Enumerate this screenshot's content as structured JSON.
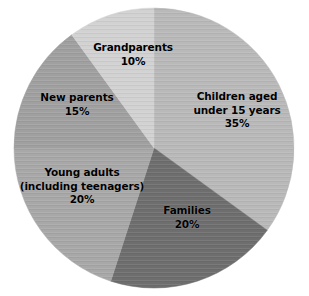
{
  "chart_data": {
    "type": "pie",
    "title": "",
    "subtitle": "",
    "xlabel": "",
    "ylabel": "",
    "units": "percent",
    "legend_position": "none",
    "labels_position": "inside-slices",
    "grid": false,
    "total": 100,
    "start_angle_deg": 0,
    "direction": "clockwise",
    "categories": [
      "Children aged under 15 years",
      "Families",
      "Young adults (including teenagers)",
      "New parents",
      "Grandparents"
    ],
    "values": [
      35,
      20,
      20,
      15,
      10
    ],
    "slices": [
      {
        "name": "children-aged-under-15-years",
        "label_lines": [
          "Children aged",
          "under 15 years"
        ],
        "value": 35,
        "value_label": "35%",
        "color": "#b9b9b9",
        "angle_deg": 126,
        "start_deg": 0,
        "end_deg": 126
      },
      {
        "name": "families",
        "label_lines": [
          "Families"
        ],
        "value": 20,
        "value_label": "20%",
        "color": "#6e6e6e",
        "angle_deg": 72,
        "start_deg": 126,
        "end_deg": 198
      },
      {
        "name": "young-adults",
        "label_lines": [
          "Young adults",
          "(including teenagers)"
        ],
        "value": 20,
        "value_label": "20%",
        "color": "#a8a8a8",
        "angle_deg": 72,
        "start_deg": 198,
        "end_deg": 270
      },
      {
        "name": "new-parents",
        "label_lines": [
          "New parents"
        ],
        "value": 15,
        "value_label": "15%",
        "color": "#a0a0a0",
        "angle_deg": 54,
        "start_deg": 270,
        "end_deg": 324
      },
      {
        "name": "grandparents",
        "label_lines": [
          "Grandparents"
        ],
        "value": 10,
        "value_label": "10%",
        "color": "#d2d2d2",
        "angle_deg": 36,
        "start_deg": 324,
        "end_deg": 360
      }
    ]
  },
  "labels": {
    "children": {
      "line1": "Children aged",
      "line2": "under 15 years",
      "value": "35%"
    },
    "families": {
      "line1": "Families",
      "value": "20%"
    },
    "young_adults": {
      "line1": "Young adults",
      "line2": "(including teenagers)",
      "value": "20%"
    },
    "new_parents": {
      "line1": "New parents",
      "value": "15%"
    },
    "grandparents": {
      "line1": "Grandparents",
      "value": "10%"
    }
  },
  "colors": {
    "background": "#ffffff",
    "text": "#000000",
    "children": "#b9b9b9",
    "families": "#6e6e6e",
    "young_adults": "#a8a8a8",
    "new_parents": "#a0a0a0",
    "grandparents": "#d2d2d2"
  }
}
